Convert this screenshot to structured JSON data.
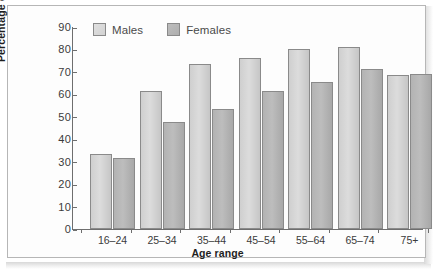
{
  "chart_data": {
    "type": "bar",
    "title": "",
    "xlabel": "Age range",
    "ylabel": "Percentage overweight",
    "categories": [
      "16–24",
      "25–34",
      "35–44",
      "45–54",
      "55–64",
      "65–74",
      "75+"
    ],
    "series": [
      {
        "name": "Males",
        "color": "#d6d6d6",
        "values": [
          33.5,
          61.5,
          73.5,
          76.0,
          80.0,
          81.0,
          68.5
        ]
      },
      {
        "name": "Females",
        "color": "#b4b4b4",
        "values": [
          31.5,
          47.5,
          53.5,
          61.5,
          65.5,
          71.5,
          69.0
        ]
      }
    ],
    "ylim": [
      0,
      90
    ],
    "ytick_step": 10,
    "yticks": [
      "0",
      "10",
      "20",
      "30",
      "40",
      "50",
      "60",
      "70",
      "80",
      "90"
    ],
    "grid": false,
    "legend_position": "top-left-inside"
  },
  "legend": {
    "items": [
      {
        "label": "Males",
        "swatch": "legend-swatch-males"
      },
      {
        "label": "Females",
        "swatch": "legend-swatch-females"
      }
    ]
  }
}
